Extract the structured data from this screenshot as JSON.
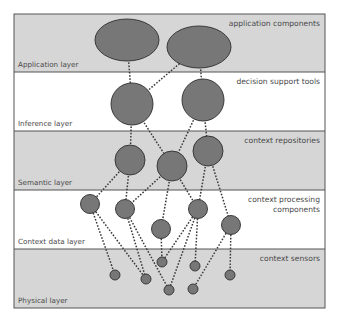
{
  "diagram": {
    "frame": {
      "x": 14,
      "y": 14,
      "width": 311,
      "height": 294
    },
    "colors": {
      "shaded": "#d6d6d6",
      "plain": "#ffffff",
      "border": "#555555",
      "node": "#777777"
    },
    "layers": [
      {
        "id": "application",
        "name": "Application layer",
        "description": [
          "application components"
        ],
        "y": 14,
        "height": 58,
        "shaded": true
      },
      {
        "id": "inference",
        "name": "Inference layer",
        "description": [
          "decision support tools"
        ],
        "y": 72,
        "height": 59,
        "shaded": false
      },
      {
        "id": "semantic",
        "name": "Semantic layer",
        "description": [
          "context repositories"
        ],
        "y": 131,
        "height": 59,
        "shaded": true
      },
      {
        "id": "context-data",
        "name": "Context data layer",
        "description": [
          "context processing",
          "components"
        ],
        "y": 190,
        "height": 59,
        "shaded": false
      },
      {
        "id": "physical",
        "name": "Physical layer",
        "description": [
          "context sensors"
        ],
        "y": 249,
        "height": 59,
        "shaded": true
      }
    ],
    "nodes": [
      {
        "id": "A1",
        "layer": "application",
        "shape": "ellipse",
        "cx": 127,
        "cy": 40,
        "rx": 32,
        "ry": 21
      },
      {
        "id": "A2",
        "layer": "application",
        "shape": "ellipse",
        "cx": 199,
        "cy": 47,
        "rx": 32,
        "ry": 21
      },
      {
        "id": "I1",
        "layer": "inference",
        "shape": "circle",
        "cx": 132,
        "cy": 104,
        "r": 21
      },
      {
        "id": "I2",
        "layer": "inference",
        "shape": "circle",
        "cx": 203,
        "cy": 100,
        "r": 21
      },
      {
        "id": "S1",
        "layer": "semantic",
        "shape": "circle",
        "cx": 130,
        "cy": 160,
        "r": 15
      },
      {
        "id": "S2",
        "layer": "semantic",
        "shape": "circle",
        "cx": 172,
        "cy": 166,
        "r": 15
      },
      {
        "id": "S3",
        "layer": "semantic",
        "shape": "circle",
        "cx": 208,
        "cy": 151,
        "r": 15
      },
      {
        "id": "C1",
        "layer": "context-data",
        "shape": "circle",
        "cx": 90,
        "cy": 204,
        "r": 9.5
      },
      {
        "id": "C2",
        "layer": "context-data",
        "shape": "circle",
        "cx": 125,
        "cy": 209,
        "r": 9.5
      },
      {
        "id": "C3",
        "layer": "context-data",
        "shape": "circle",
        "cx": 161,
        "cy": 229,
        "r": 9.5
      },
      {
        "id": "C4",
        "layer": "context-data",
        "shape": "circle",
        "cx": 198,
        "cy": 209,
        "r": 9.5
      },
      {
        "id": "C5",
        "layer": "context-data",
        "shape": "circle",
        "cx": 231,
        "cy": 225,
        "r": 9.5
      },
      {
        "id": "P1",
        "layer": "physical",
        "shape": "circle",
        "cx": 115,
        "cy": 275,
        "r": 5
      },
      {
        "id": "P2",
        "layer": "physical",
        "shape": "circle",
        "cx": 146,
        "cy": 279,
        "r": 5
      },
      {
        "id": "P3",
        "layer": "physical",
        "shape": "circle",
        "cx": 162,
        "cy": 262,
        "r": 5
      },
      {
        "id": "P4",
        "layer": "physical",
        "shape": "circle",
        "cx": 169,
        "cy": 290,
        "r": 5
      },
      {
        "id": "P5",
        "layer": "physical",
        "shape": "circle",
        "cx": 193,
        "cy": 289,
        "r": 5
      },
      {
        "id": "P6",
        "layer": "physical",
        "shape": "circle",
        "cx": 195,
        "cy": 266,
        "r": 5
      },
      {
        "id": "P7",
        "layer": "physical",
        "shape": "circle",
        "cx": 230,
        "cy": 275,
        "r": 5
      }
    ],
    "edges": [
      [
        "A1",
        "I1"
      ],
      [
        "A2",
        "I1"
      ],
      [
        "A2",
        "I2"
      ],
      [
        "I1",
        "S1"
      ],
      [
        "I1",
        "S2"
      ],
      [
        "I2",
        "S2"
      ],
      [
        "I2",
        "S3"
      ],
      [
        "S1",
        "C1"
      ],
      [
        "S1",
        "C2"
      ],
      [
        "S2",
        "C2"
      ],
      [
        "S2",
        "C3"
      ],
      [
        "S2",
        "C4"
      ],
      [
        "S3",
        "C4"
      ],
      [
        "S3",
        "C5"
      ],
      [
        "C1",
        "P1"
      ],
      [
        "C1",
        "P2"
      ],
      [
        "C2",
        "P2"
      ],
      [
        "C2",
        "P4"
      ],
      [
        "C3",
        "P3"
      ],
      [
        "C4",
        "P3"
      ],
      [
        "C4",
        "P4"
      ],
      [
        "C4",
        "P6"
      ],
      [
        "C5",
        "P5"
      ],
      [
        "C5",
        "P7"
      ]
    ]
  }
}
